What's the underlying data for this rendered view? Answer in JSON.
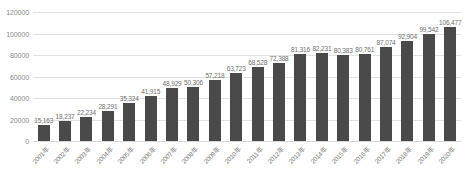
{
  "chart_data": {
    "type": "bar",
    "title": "",
    "subtitle": "",
    "xlabel": "",
    "ylabel": "",
    "ylim": [
      0,
      120000
    ],
    "ytick_step": 20000,
    "ytick_labels": [
      "0",
      "20000",
      "40000",
      "60000",
      "80000",
      "100000",
      "120000"
    ],
    "ytick_values": [
      0,
      20000,
      40000,
      60000,
      80000,
      100000,
      120000
    ],
    "grid": true,
    "legend": false,
    "legend_position": "none",
    "bar_color": "#4a4a4a",
    "gridline_color": "#e2e2e2",
    "label_color": "#6f6f6f",
    "background_color": "#ffffff",
    "categories": [
      "2001年",
      "2002年",
      "2003年",
      "2004年",
      "2005年",
      "2006年",
      "2007年",
      "2008年",
      "2009年",
      "2010年",
      "2011年",
      "2012年",
      "2013年",
      "2014年",
      "2015年",
      "2016年",
      "2017年",
      "2018年",
      "2019年",
      "2020年"
    ],
    "values": [
      15163,
      18237,
      22234,
      28291,
      35324,
      41915,
      48929,
      50306,
      57218,
      63723,
      68528,
      72388,
      81316,
      82231,
      80383,
      80761,
      87074,
      92904,
      99542,
      106477
    ],
    "data_labels": [
      "15,163",
      "18,237",
      "22,234",
      "28,291",
      "35,324",
      "41,915",
      "48,929",
      "50,306",
      "57,218",
      "63,723",
      "68,528",
      "72,388",
      "81,316",
      "82,231",
      "80,383",
      "80,761",
      "87,074",
      "92,904",
      "99,542",
      "106,477"
    ]
  }
}
